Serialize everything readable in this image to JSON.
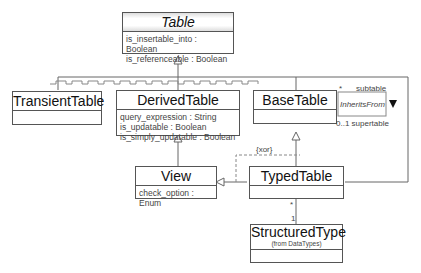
{
  "classes": {
    "table": {
      "name": "Table",
      "attrs": [
        "is_insertable_into : Boolean",
        "is_referenceable : Boolean"
      ]
    },
    "transient": {
      "name": "TransientTable"
    },
    "derived": {
      "name": "DerivedTable",
      "attrs": [
        "query_expression : String",
        "is_updatable : Boolean",
        "is_simply_updatable : Boolean"
      ]
    },
    "base": {
      "name": "BaseTable"
    },
    "view": {
      "name": "View",
      "attrs": [
        "check_option : Enum"
      ]
    },
    "typed": {
      "name": "TypedTable"
    },
    "structured": {
      "name": "StructuredType",
      "stereotype": "(from DataTypes)"
    }
  },
  "association": {
    "name": "InheritsFrom",
    "role_sub_mult": "*",
    "role_sub": "subtable",
    "role_super": "0..1 supertable",
    "constraint": "{xor}",
    "typed_mult": "*",
    "structured_mult": "1"
  }
}
